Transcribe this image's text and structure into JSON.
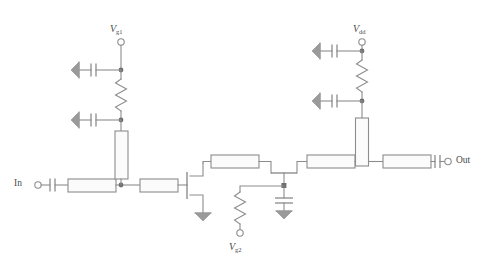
{
  "figure": {
    "kind": "circuit-schematic",
    "stroke_color": "#8c8c8c",
    "background_color": "#ffffff",
    "label_color": "#4a4a4a"
  },
  "labels": {
    "input": {
      "text": "In",
      "sub": "",
      "x": 16,
      "y": 178
    },
    "output": {
      "text": "Out",
      "sub": "",
      "x": 459,
      "y": 176
    },
    "vg1": {
      "text": "V",
      "sub": "g1",
      "x": 110,
      "y": 9
    },
    "vg2": {
      "text": "V",
      "sub": "g2",
      "x": 231,
      "y": 247
    },
    "vdd": {
      "text": "V",
      "sub": "dd",
      "x": 355,
      "y": 9
    }
  },
  "terminals": [
    {
      "name": "in-terminal",
      "x": 38,
      "y": 185
    },
    {
      "name": "out-terminal",
      "x": 450,
      "y": 184
    },
    {
      "name": "vg1-terminal",
      "x": 121,
      "y": 42
    },
    {
      "name": "vg2-terminal",
      "x": 240,
      "y": 233
    },
    {
      "name": "vdd-terminal",
      "x": 362,
      "y": 42
    }
  ],
  "components": {
    "transmission_lines": [
      {
        "name": "tl-input-series",
        "orientation": "horizontal",
        "x": 68,
        "y": 179,
        "w": 48,
        "h": 13
      },
      {
        "name": "tl-gate1-stub",
        "orientation": "vertical",
        "x": 115,
        "y": 131,
        "w": 13,
        "h": 48
      },
      {
        "name": "tl-gate1-series",
        "orientation": "horizontal",
        "x": 140,
        "y": 179,
        "w": 38,
        "h": 13
      },
      {
        "name": "tl-interstage-1",
        "orientation": "horizontal",
        "x": 211,
        "y": 155,
        "w": 48,
        "h": 13
      },
      {
        "name": "tl-interstage-2",
        "orientation": "horizontal",
        "x": 307,
        "y": 155,
        "w": 48,
        "h": 13
      },
      {
        "name": "tl-drain-stub",
        "orientation": "vertical",
        "x": 355,
        "y": 118,
        "w": 13,
        "h": 48
      },
      {
        "name": "tl-output-series",
        "orientation": "horizontal",
        "x": 383,
        "y": 155,
        "w": 48,
        "h": 13
      }
    ],
    "resistors": [
      {
        "name": "resistor-gate1-bias",
        "orientation": "vertical",
        "x": 121,
        "y": 77,
        "length": 36
      },
      {
        "name": "resistor-gate2-bias",
        "orientation": "vertical",
        "x": 240,
        "y": 192,
        "length": 36
      },
      {
        "name": "resistor-drain-bias",
        "orientation": "vertical",
        "x": 362,
        "y": 64,
        "length": 36
      }
    ],
    "capacitors": [
      {
        "name": "cap-input-dc-block",
        "orientation": "horizontal",
        "x": 52,
        "y": 185
      },
      {
        "name": "cap-output-dc-block",
        "orientation": "horizontal",
        "x": 437,
        "y": 167
      },
      {
        "name": "cap-vg1-bypass-upper",
        "orientation": "horizontal",
        "x": 98,
        "y": 70
      },
      {
        "name": "cap-vg1-bypass-lower",
        "orientation": "horizontal",
        "x": 98,
        "y": 120
      },
      {
        "name": "cap-vdd-bypass-upper",
        "orientation": "horizontal",
        "x": 339,
        "y": 51
      },
      {
        "name": "cap-vdd-bypass-lower",
        "orientation": "horizontal",
        "x": 339,
        "y": 101
      },
      {
        "name": "cap-gate2-bypass",
        "orientation": "vertical",
        "x": 284,
        "y": 200
      }
    ],
    "transistors": [
      {
        "name": "transistor-q1",
        "type": "fet-common-source",
        "x": 186,
        "y": 186
      },
      {
        "name": "transistor-q2",
        "type": "fet-common-gate",
        "x": 284,
        "y": 173
      }
    ],
    "grounds": [
      {
        "name": "ground-q1-source",
        "orientation": "down",
        "x": 203,
        "y": 216
      },
      {
        "name": "ground-cap-vg1-upper",
        "orientation": "left",
        "x": 76,
        "y": 70
      },
      {
        "name": "ground-cap-vg1-lower",
        "orientation": "left",
        "x": 76,
        "y": 120
      },
      {
        "name": "ground-cap-vdd-upper",
        "orientation": "left",
        "x": 317,
        "y": 51
      },
      {
        "name": "ground-cap-vdd-lower",
        "orientation": "left",
        "x": 317,
        "y": 101
      },
      {
        "name": "ground-cap-gate2",
        "orientation": "down",
        "x": 284,
        "y": 216
      }
    ],
    "junction_nodes": [
      {
        "name": "node-gate1-bias-top",
        "x": 121,
        "y": 70
      },
      {
        "name": "node-gate1-bias-bottom",
        "x": 121,
        "y": 120
      },
      {
        "name": "node-gate1-input",
        "x": 121,
        "y": 185
      },
      {
        "name": "node-gate2",
        "x": 284,
        "y": 186
      },
      {
        "name": "node-vdd-bias-top",
        "x": 362,
        "y": 51
      },
      {
        "name": "node-vdd-bias-bottom",
        "x": 362,
        "y": 101
      },
      {
        "name": "node-drain-output",
        "x": 362,
        "y": 161
      }
    ]
  }
}
